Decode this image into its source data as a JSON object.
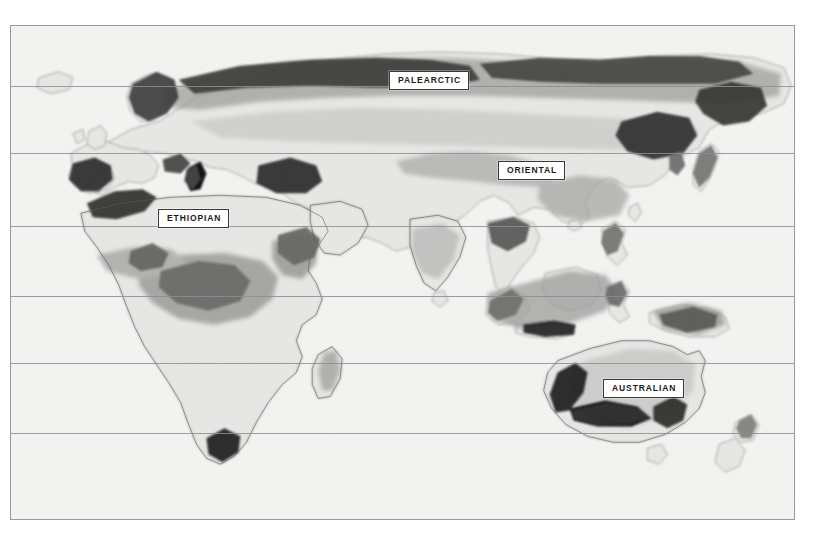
{
  "map": {
    "title": "Biogeographic Realms",
    "frame": {
      "left": 10,
      "top": 25,
      "width": 785,
      "height": 495
    },
    "background_color": "#f4f4f3",
    "border_color": "#9a9a9a",
    "page_background": "#ffffff",
    "gridline_color": "#8d8d8d",
    "latitude_gridlines": [
      {
        "name": "gridline-1",
        "y": 60
      },
      {
        "name": "gridline-2",
        "y": 127
      },
      {
        "name": "gridline-3",
        "y": 200
      },
      {
        "name": "gridline-4",
        "y": 270
      },
      {
        "name": "gridline-5",
        "y": 337
      },
      {
        "name": "gridline-6",
        "y": 407
      }
    ],
    "labels": [
      {
        "id": "palearctic",
        "text": "PALEARCTIC",
        "x": 378,
        "y": 45
      },
      {
        "id": "oriental",
        "text": "ORIENTAL",
        "x": 487,
        "y": 135
      },
      {
        "id": "ethiopian",
        "text": "ETHIOPIAN",
        "x": 147,
        "y": 183
      },
      {
        "id": "australian",
        "text": "AUSTRALIAN",
        "x": 592,
        "y": 353
      }
    ],
    "shading": {
      "land_base": "#ededec",
      "tone_light": "#dcdcda",
      "tone_medium": "#bcbcba",
      "tone_dark": "#8f8f8d",
      "tone_darkest": "#4a4a48",
      "coastline": "#6f6f6d"
    },
    "landmasses": [
      "Eurasia",
      "Africa",
      "Arabian Peninsula",
      "Indian Subcontinent",
      "Southeast Asian Archipelago",
      "Australia",
      "New Guinea",
      "New Zealand",
      "Japan",
      "Madagascar",
      "Iceland",
      "British Isles",
      "Scandinavia",
      "Philippines",
      "Sri Lanka",
      "Tasmania"
    ]
  }
}
